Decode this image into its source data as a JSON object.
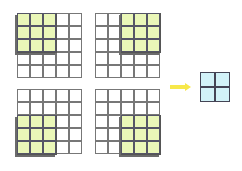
{
  "diagram": {
    "input_grid": {
      "rows": 5,
      "cols": 5
    },
    "window": {
      "rows": 3,
      "cols": 3,
      "color": "#eaf7b8"
    },
    "panels": [
      {
        "name": "top-left",
        "window_row": 0,
        "window_col": 0,
        "x": 17,
        "y": 13
      },
      {
        "name": "top-right",
        "window_row": 0,
        "window_col": 2,
        "x": 95,
        "y": 13
      },
      {
        "name": "bottom-left",
        "window_row": 2,
        "window_col": 0,
        "x": 17,
        "y": 89
      },
      {
        "name": "bottom-right",
        "window_row": 2,
        "window_col": 2,
        "x": 95,
        "y": 89
      }
    ],
    "arrow": {
      "color": "#f7e84a"
    },
    "output_grid": {
      "rows": 2,
      "cols": 2,
      "color": "#d2f2f8"
    }
  }
}
